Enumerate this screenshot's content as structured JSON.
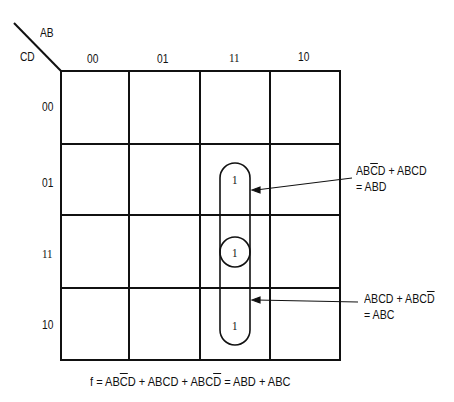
{
  "diagram": {
    "type": "karnaugh-map",
    "axis": {
      "row_var": "CD",
      "col_var": "AB"
    },
    "columns": [
      "00",
      "01",
      "11",
      "10"
    ],
    "rows": [
      "00",
      "01",
      "11",
      "10"
    ],
    "cells": [
      {
        "row": "01",
        "col": "11",
        "value": "1"
      },
      {
        "row": "11",
        "col": "11",
        "value": "1"
      },
      {
        "row": "10",
        "col": "11",
        "value": "1"
      }
    ],
    "groups": [
      {
        "cells": [
          "0111",
          "1111"
        ],
        "line1_parts": [
          "AB",
          "C",
          "D + ABCD"
        ],
        "line2": "= ABD"
      },
      {
        "cells": [
          "1111",
          "1110"
        ],
        "line1_parts": [
          "ABCD + ABC",
          "D"
        ],
        "line2": "= ABC"
      }
    ],
    "formula_parts": [
      "f = AB",
      "C",
      "D + ABCD + ABC",
      "D",
      " = ABD + ABC"
    ]
  }
}
